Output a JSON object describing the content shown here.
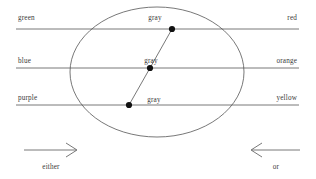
{
  "figure": {
    "title": "",
    "background_color": "#ffffff",
    "stroke_color": "#555555",
    "text_color": "#3a3a3a",
    "dot_color": "#111111"
  },
  "rows": [
    {
      "left_label": "green",
      "right_label": "red",
      "mid_label": "gray"
    },
    {
      "left_label": "blue",
      "right_label": "orange",
      "mid_label": "gray"
    },
    {
      "left_label": "purple",
      "right_label": "yellow",
      "mid_label": "gray"
    }
  ],
  "arrows": {
    "left": {
      "label": "either",
      "direction": "right"
    },
    "right": {
      "label": "or",
      "direction": "left"
    }
  },
  "points": [
    {
      "label": "gray",
      "x": 172,
      "y": 29
    },
    {
      "label": "gray",
      "x": 150,
      "y": 68
    },
    {
      "label": "gray",
      "x": 129,
      "y": 105
    }
  ],
  "ellipse": {
    "cx": 157,
    "cy": 72,
    "rx": 87,
    "ry": 65
  }
}
